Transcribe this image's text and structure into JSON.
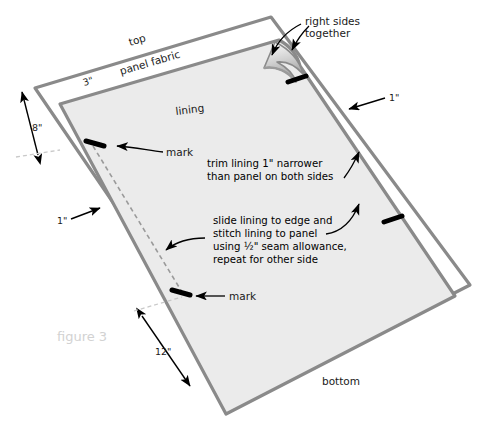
{
  "figure": {
    "caption": "figure 3"
  },
  "colors": {
    "panel_outline": "#8a8a8a",
    "panel_fill": "#ffffff",
    "lining_fill": "#ebebeb",
    "lining_outline": "#8a8a8a",
    "mark_color": "#000000",
    "stitch_dash": "#9a9a9a",
    "caption_color": "#d2d2d2",
    "text_color": "#1a1a1a",
    "shade": "#b9b9b9"
  },
  "labels": {
    "top": "top",
    "bottom": "bottom",
    "panel_fabric": "panel fabric",
    "lining": "lining",
    "right_sides_together": "right sides\ntogether",
    "right_sides_together_line1": "right sides",
    "right_sides_together_line2": "together",
    "mark_upper": "mark",
    "mark_lower": "mark"
  },
  "dimensions": [
    {
      "id": "top-seam-allowance",
      "value": "3\""
    },
    {
      "id": "left-top-offset",
      "value": "8\""
    },
    {
      "id": "right-trim",
      "value": "1\""
    },
    {
      "id": "left-trim",
      "value": "1\""
    },
    {
      "id": "bottom-left-offset",
      "value": "12\""
    }
  ],
  "callouts": {
    "trim": {
      "line1": "trim lining 1\" narrower",
      "line2": "than panel on both sides"
    },
    "slide": {
      "line1": "slide lining to edge and",
      "line2": "stitch lining to panel",
      "line3_pre": "using ",
      "line3_frac": "½",
      "line3_post": "\" seam allowance,",
      "line3_full": "using ½\" seam allowance,",
      "line4": "repeat for other side"
    }
  }
}
